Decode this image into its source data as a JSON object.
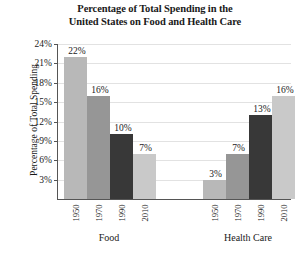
{
  "chart_data": {
    "type": "bar",
    "title": "Percentage of Total Spending in the United States on Food and Health Care",
    "title_line1": "Percentage of Total Spending in the",
    "title_line2": "United States on Food and Health Care",
    "xlabel": "",
    "ylabel": "Percentage of Total Spending",
    "ylim": [
      0,
      24
    ],
    "ytick_labels": [
      "24%",
      "21%",
      "18%",
      "15%",
      "12%",
      "9%",
      "6%",
      "3%"
    ],
    "ytick_values": [
      24,
      21,
      18,
      15,
      12,
      9,
      6,
      3
    ],
    "grid": true,
    "legend": "none",
    "categories": [
      "1950",
      "1970",
      "1990",
      "2010"
    ],
    "groups": [
      {
        "name": "Food",
        "bars": [
          {
            "year": "1950",
            "value": 22,
            "label": "22%",
            "color": "#b8b8b8"
          },
          {
            "year": "1970",
            "value": 16,
            "label": "16%",
            "color": "#969696"
          },
          {
            "year": "1990",
            "value": 10,
            "label": "10%",
            "color": "#383838"
          },
          {
            "year": "2010",
            "value": 7,
            "label": "7%",
            "color": "#c9c9c9"
          }
        ]
      },
      {
        "name": "Health Care",
        "bars": [
          {
            "year": "1950",
            "value": 3,
            "label": "3%",
            "color": "#b8b8b8"
          },
          {
            "year": "1970",
            "value": 7,
            "label": "7%",
            "color": "#969696"
          },
          {
            "year": "1990",
            "value": 13,
            "label": "13%",
            "color": "#383838"
          },
          {
            "year": "2010",
            "value": 16,
            "label": "16%",
            "color": "#c9c9c9"
          }
        ]
      }
    ]
  }
}
